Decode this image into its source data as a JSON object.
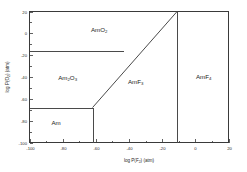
{
  "figure": {
    "background_color": "#ffffff",
    "line_color": "#4a4a4a",
    "axis_color": "#3a3a3a",
    "text_color": "#1a1a1a"
  },
  "chart_data": {
    "type": "line",
    "title": "",
    "subtitle": "",
    "xlabel": "log P(F2) (atm)",
    "xlabel_parts": {
      "pre": "log P(F",
      "sub": "2",
      "post": ") (atm)"
    },
    "ylabel": "log P(O2) (atm)",
    "ylabel_parts": {
      "pre": "log P(O",
      "sub": "2",
      "post": ") (atm)"
    },
    "xlim": [
      -100,
      20
    ],
    "ylim": [
      -100,
      20
    ],
    "grid": false,
    "legend": "none",
    "xticks": [
      -100,
      -80,
      -60,
      -40,
      -20,
      0,
      20
    ],
    "xtick_labels": [
      "-100",
      "-80",
      "-60",
      "-40",
      "-20",
      "0",
      "20"
    ],
    "yticks": [
      -100,
      -80,
      -60,
      -40,
      -20,
      0,
      20
    ],
    "ytick_labels": [
      "-100",
      "-80",
      "-60",
      "-40",
      "-20",
      "0",
      "20"
    ],
    "minor_xticks": [
      -90,
      -70,
      -50,
      -30,
      -10,
      10
    ],
    "minor_yticks": [
      -90,
      -70,
      -50,
      -30,
      -10,
      10
    ],
    "regions": [
      {
        "name": "AmO2",
        "label_parts": {
          "pre": "AmO",
          "sub": "2",
          "post": ""
        },
        "label_x": -58,
        "label_y": 1
      },
      {
        "name": "Am2O3",
        "label_parts": {
          "pre": "Am",
          "sub": "2",
          "mid": "O",
          "sub2": "3",
          "post": ""
        },
        "label_x": -77,
        "label_y": -43
      },
      {
        "name": "Am",
        "label_parts": {
          "pre": "Am",
          "sub": "",
          "post": ""
        },
        "label_x": -84,
        "label_y": -84
      },
      {
        "name": "AmF3",
        "label_parts": {
          "pre": "AmF",
          "sub": "3",
          "post": ""
        },
        "label_x": -36,
        "label_y": -46
      },
      {
        "name": "AmF4",
        "label_parts": {
          "pre": "AmF",
          "sub": "4",
          "post": ""
        },
        "label_x": 5,
        "label_y": -42
      }
    ],
    "boundaries": [
      {
        "name": "AmO2-Am2O3-boundary",
        "kind": "horizontal",
        "points": [
          [
            -100,
            -16
          ],
          [
            -43,
            -16
          ]
        ]
      },
      {
        "name": "Am2O3-Am-boundary",
        "kind": "horizontal",
        "points": [
          [
            -100,
            -68
          ],
          [
            -62,
            -68
          ]
        ]
      },
      {
        "name": "Am-AmF3-boundary",
        "kind": "vertical",
        "points": [
          [
            -62,
            -68
          ],
          [
            -62,
            -100
          ]
        ]
      },
      {
        "name": "oxide-fluoride-diagonal",
        "kind": "diagonal",
        "points": [
          [
            -62,
            -68
          ],
          [
            -11,
            20
          ]
        ]
      },
      {
        "name": "AmF3-AmF4-boundary",
        "kind": "vertical",
        "points": [
          [
            -11,
            20
          ],
          [
            -11,
            -100
          ]
        ]
      }
    ]
  }
}
